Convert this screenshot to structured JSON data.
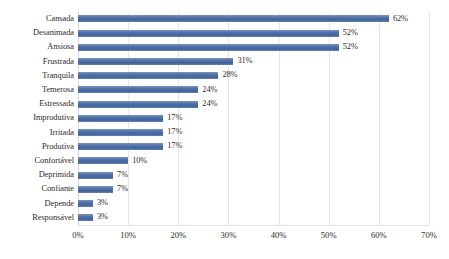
{
  "chart_data": {
    "type": "bar",
    "orientation": "horizontal",
    "title": "",
    "subtitle": "",
    "xlabel": "",
    "ylabel": "",
    "xlim": [
      0,
      70
    ],
    "xtick_labels": [
      "0%",
      "10%",
      "20%",
      "30%",
      "40%",
      "50%",
      "60%",
      "70%"
    ],
    "xticks": [
      0,
      10,
      20,
      30,
      40,
      50,
      60,
      70
    ],
    "grid": true,
    "legend": "none",
    "value_suffix": "%",
    "bar_color": "#4a6fa5",
    "categories": [
      "Cansada",
      "Desanimada",
      "Ansiosa",
      "Frustrada",
      "Tranquila",
      "Temerosa",
      "Estressada",
      "Improdutiva",
      "Irritada",
      "Produtiva",
      "Confortável",
      "Deprimida",
      "Confiante",
      "Depende",
      "Responsável"
    ],
    "values": [
      62,
      52,
      52,
      31,
      28,
      24,
      24,
      17,
      17,
      17,
      10,
      7,
      7,
      3,
      3
    ],
    "data_labels": [
      "62%",
      "52%",
      "52%",
      "31%",
      "28%",
      "24%",
      "24%",
      "17%",
      "17%",
      "17%",
      "10%",
      "7%",
      "7%",
      "3%",
      "3%"
    ]
  }
}
